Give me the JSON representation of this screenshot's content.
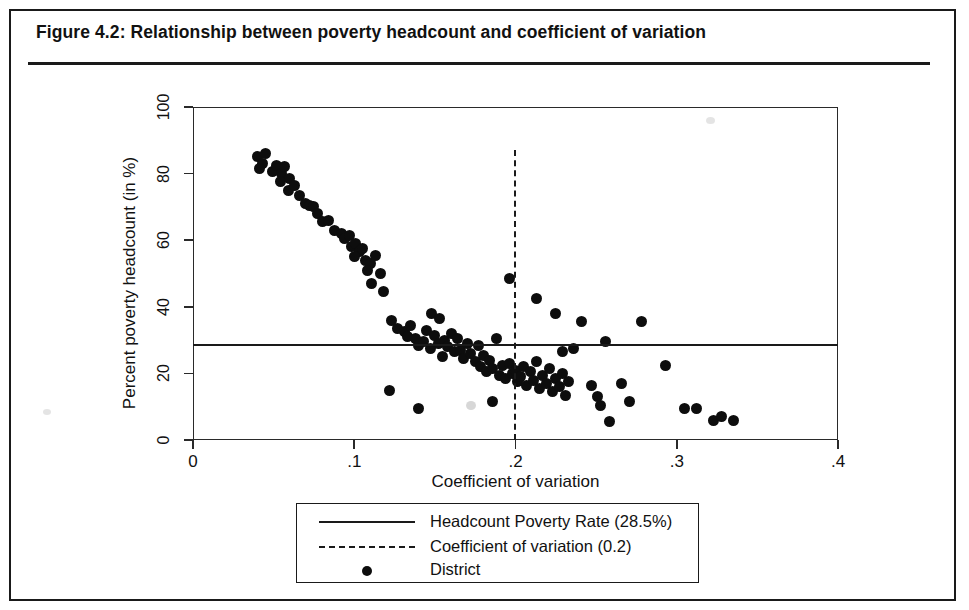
{
  "figure": {
    "title": "Figure 4.2:  Relationship between poverty headcount and coefficient of variation"
  },
  "chart_data": {
    "type": "scatter",
    "title": "Figure 4.2:  Relationship between poverty headcount and coefficient of variation",
    "xlabel": "Coefficient of variation",
    "ylabel": "Percent poverty headcount (in %)",
    "xlim": [
      0,
      0.4
    ],
    "ylim": [
      0,
      100
    ],
    "xticks": [
      0,
      0.1,
      0.2,
      0.3,
      0.4
    ],
    "xtick_labels": [
      "0",
      ".1",
      ".2",
      ".3",
      ".4"
    ],
    "yticks": [
      0,
      20,
      40,
      60,
      80,
      100
    ],
    "ytick_labels": [
      "0",
      "20",
      "40",
      "60",
      "80",
      "100"
    ],
    "grid": false,
    "legend_position": "below-axes",
    "legend": [
      {
        "marker": "solid-line",
        "label": "Headcount Poverty Rate (28.5%)"
      },
      {
        "marker": "dashed-line",
        "label": "Coefficient of variation (0.2)"
      },
      {
        "marker": "filled-circle",
        "label": "District"
      }
    ],
    "reference_lines": [
      {
        "orientation": "horizontal",
        "value": 28.5,
        "style": "solid",
        "label": "Headcount Poverty Rate (28.5%)"
      },
      {
        "orientation": "vertical",
        "value": 0.2,
        "style": "dashed",
        "label": "Coefficient of variation (0.2)",
        "y_top": 87,
        "y_bottom": 0
      }
    ],
    "series": [
      {
        "name": "District",
        "marker": "filled-circle",
        "color": "#0d0d0d",
        "points": [
          [
            0.04,
            85.0
          ],
          [
            0.043,
            83.0
          ],
          [
            0.045,
            86.0
          ],
          [
            0.041,
            81.5
          ],
          [
            0.049,
            80.5
          ],
          [
            0.052,
            82.5
          ],
          [
            0.055,
            80.0
          ],
          [
            0.054,
            77.5
          ],
          [
            0.057,
            82.0
          ],
          [
            0.06,
            78.5
          ],
          [
            0.059,
            75.0
          ],
          [
            0.063,
            76.5
          ],
          [
            0.066,
            73.5
          ],
          [
            0.07,
            71.0
          ],
          [
            0.072,
            70.5
          ],
          [
            0.075,
            70.0
          ],
          [
            0.077,
            68.0
          ],
          [
            0.08,
            65.5
          ],
          [
            0.084,
            66.0
          ],
          [
            0.088,
            63.0
          ],
          [
            0.092,
            62.0
          ],
          [
            0.094,
            60.5
          ],
          [
            0.097,
            61.5
          ],
          [
            0.098,
            58.0
          ],
          [
            0.101,
            59.0
          ],
          [
            0.103,
            56.5
          ],
          [
            0.105,
            57.5
          ],
          [
            0.1,
            55.0
          ],
          [
            0.107,
            54.0
          ],
          [
            0.11,
            53.0
          ],
          [
            0.108,
            51.0
          ],
          [
            0.113,
            55.5
          ],
          [
            0.116,
            50.0
          ],
          [
            0.111,
            47.0
          ],
          [
            0.118,
            44.5
          ],
          [
            0.123,
            36.0
          ],
          [
            0.127,
            33.5
          ],
          [
            0.131,
            32.5
          ],
          [
            0.135,
            34.5
          ],
          [
            0.133,
            31.0
          ],
          [
            0.138,
            30.5
          ],
          [
            0.14,
            28.5
          ],
          [
            0.143,
            29.5
          ],
          [
            0.145,
            33.0
          ],
          [
            0.147,
            27.5
          ],
          [
            0.15,
            31.5
          ],
          [
            0.152,
            29.0
          ],
          [
            0.148,
            38.0
          ],
          [
            0.153,
            36.5
          ],
          [
            0.156,
            30.0
          ],
          [
            0.158,
            28.0
          ],
          [
            0.16,
            32.0
          ],
          [
            0.162,
            26.5
          ],
          [
            0.155,
            25.0
          ],
          [
            0.164,
            30.5
          ],
          [
            0.166,
            27.0
          ],
          [
            0.168,
            24.5
          ],
          [
            0.17,
            29.0
          ],
          [
            0.172,
            26.0
          ],
          [
            0.175,
            23.5
          ],
          [
            0.177,
            28.5
          ],
          [
            0.178,
            22.0
          ],
          [
            0.18,
            25.5
          ],
          [
            0.182,
            20.5
          ],
          [
            0.184,
            24.0
          ],
          [
            0.186,
            21.5
          ],
          [
            0.188,
            30.5
          ],
          [
            0.19,
            19.5
          ],
          [
            0.192,
            22.5
          ],
          [
            0.194,
            18.5
          ],
          [
            0.196,
            23.0
          ],
          [
            0.198,
            20.0
          ],
          [
            0.2,
            21.0
          ],
          [
            0.201,
            17.5
          ],
          [
            0.203,
            19.0
          ],
          [
            0.205,
            22.0
          ],
          [
            0.207,
            16.5
          ],
          [
            0.209,
            20.5
          ],
          [
            0.211,
            18.0
          ],
          [
            0.213,
            23.5
          ],
          [
            0.215,
            15.5
          ],
          [
            0.217,
            19.5
          ],
          [
            0.219,
            17.0
          ],
          [
            0.221,
            21.5
          ],
          [
            0.223,
            14.5
          ],
          [
            0.225,
            18.5
          ],
          [
            0.227,
            16.0
          ],
          [
            0.229,
            20.0
          ],
          [
            0.231,
            13.5
          ],
          [
            0.233,
            17.5
          ],
          [
            0.122,
            15.0
          ],
          [
            0.14,
            9.5
          ],
          [
            0.186,
            11.5
          ],
          [
            0.196,
            48.5
          ],
          [
            0.213,
            42.5
          ],
          [
            0.225,
            38.0
          ],
          [
            0.229,
            26.5
          ],
          [
            0.236,
            27.5
          ],
          [
            0.241,
            35.5
          ],
          [
            0.247,
            16.5
          ],
          [
            0.251,
            13.0
          ],
          [
            0.253,
            10.5
          ],
          [
            0.256,
            29.5
          ],
          [
            0.258,
            5.5
          ],
          [
            0.266,
            17.0
          ],
          [
            0.271,
            11.5
          ],
          [
            0.278,
            35.5
          ],
          [
            0.293,
            22.5
          ],
          [
            0.305,
            9.5
          ],
          [
            0.312,
            9.5
          ],
          [
            0.323,
            6.0
          ],
          [
            0.328,
            7.0
          ],
          [
            0.335,
            6.0
          ]
        ]
      }
    ]
  }
}
